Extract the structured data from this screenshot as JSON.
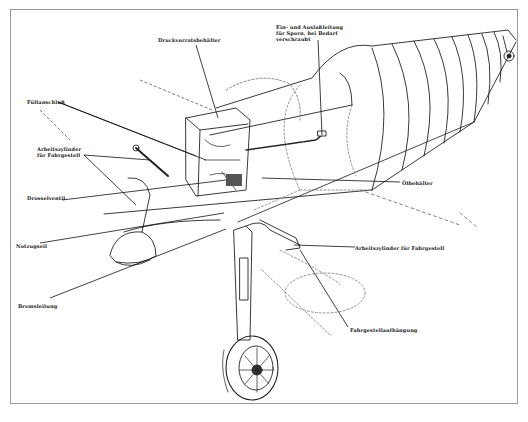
{
  "diagram": {
    "title": "",
    "labels": [
      {
        "id": "druckvorratsbehaelter",
        "text": "Druckvorratsbehälter",
        "x": 158,
        "y": 37
      },
      {
        "id": "ein-und-auslassleitung",
        "text": "Ein- und Auslaßleitung\nfür Sporn, bei Bedarf\nverschraubt",
        "x": 276,
        "y": 24
      },
      {
        "id": "fuellanschluss",
        "text": "Füllanschluß",
        "x": 27,
        "y": 99
      },
      {
        "id": "arbeitszylinder-links",
        "text": "Arbeitszylinder\nfür Fahrgestell",
        "x": 37,
        "y": 146
      },
      {
        "id": "drosselventil",
        "text": "Drosselventil",
        "x": 27,
        "y": 195
      },
      {
        "id": "oelbehaelter",
        "text": "Ölbehälter",
        "x": 402,
        "y": 180
      },
      {
        "id": "notzugseil",
        "text": "Notzugseil",
        "x": 16,
        "y": 243
      },
      {
        "id": "bremsleitung",
        "text": "Bremsleitung",
        "x": 18,
        "y": 303
      },
      {
        "id": "arbeitszylinder-rechts",
        "text": "Arbeitszylinder für Fahrgestell",
        "x": 355,
        "y": 245
      },
      {
        "id": "fahrgestellaufhaengung",
        "text": "Fahrgestellaufhängung",
        "x": 350,
        "y": 327
      }
    ]
  }
}
